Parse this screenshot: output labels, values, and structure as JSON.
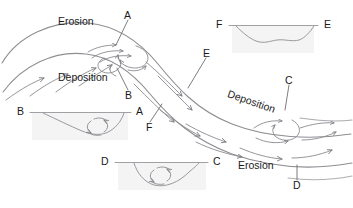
{
  "figure": {
    "background_color": "#ffffff",
    "line_color": "#8e8e93",
    "label_color": "#1a1a1a",
    "inset_fill": "#f4f4f4"
  },
  "plan_labels": {
    "erosion_top": "Erosion",
    "deposition_left": "Deposition",
    "deposition_right": "Deposition",
    "erosion_bottom": "Erosion",
    "section_a": "A",
    "section_b": "B",
    "section_c": "C",
    "section_d": "D",
    "section_e": "E",
    "section_f": "F"
  },
  "insets": [
    {
      "name": "cross-section-fe",
      "left_label": "F",
      "right_label": "E",
      "shape": "symmetric-shallow-trough",
      "position": "top-right"
    },
    {
      "name": "cross-section-ba",
      "left_label": "B",
      "right_label": "A",
      "shape": "asymmetric-deep-right",
      "position": "middle-left",
      "has_circulation_arrow": true
    },
    {
      "name": "cross-section-dc",
      "left_label": "D",
      "right_label": "C",
      "shape": "asymmetric-deep-right",
      "position": "bottom-center",
      "has_circulation_arrow": true
    }
  ]
}
